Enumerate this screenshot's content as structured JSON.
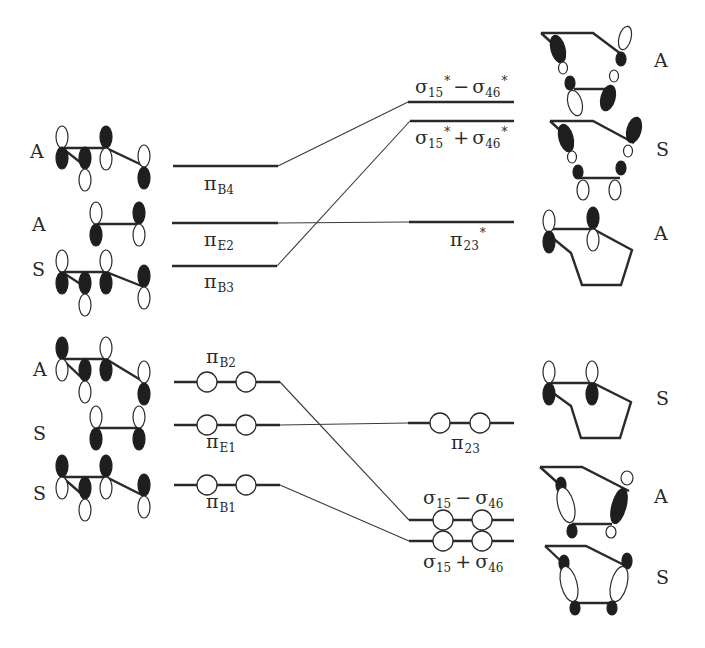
{
  "diagram": {
    "colors": {
      "ink": "#2a2a2a",
      "filled_lobe": "#1e1e1e",
      "background": "#ffffff"
    },
    "left_levels": [
      {
        "id": "piB4",
        "label": "π",
        "sub": "B4",
        "sup": "",
        "symmetry": "A",
        "y": 166,
        "x1": 173,
        "x2": 278,
        "occupied": false,
        "label_pos": "below"
      },
      {
        "id": "piE2",
        "label": "π",
        "sub": "E2",
        "sup": "",
        "symmetry": "A",
        "y": 223,
        "x1": 172,
        "x2": 278,
        "occupied": false,
        "label_pos": "below"
      },
      {
        "id": "piB3",
        "label": "π",
        "sub": "B3",
        "sup": "",
        "symmetry": "S",
        "y": 266,
        "x1": 172,
        "x2": 277,
        "occupied": false,
        "label_pos": "below"
      },
      {
        "id": "piB2",
        "label": "π",
        "sub": "B2",
        "sup": "",
        "symmetry": "A",
        "y": 382,
        "x1": 174,
        "x2": 280,
        "occupied": true,
        "label_pos": "above"
      },
      {
        "id": "piE1",
        "label": "π",
        "sub": "E1",
        "sup": "",
        "symmetry": "S",
        "y": 425,
        "x1": 174,
        "x2": 280,
        "occupied": true,
        "label_pos": "below"
      },
      {
        "id": "piB1",
        "label": "π",
        "sub": "B1",
        "sup": "",
        "symmetry": "S",
        "y": 485,
        "x1": 174,
        "x2": 280,
        "occupied": true,
        "label_pos": "below"
      }
    ],
    "right_levels": [
      {
        "id": "sigStarMinus",
        "text": "σ15* − σ46*",
        "symmetry": "A",
        "y": 102,
        "x1": 408,
        "x2": 514,
        "occupied": false,
        "label_pos": "above"
      },
      {
        "id": "sigStarPlus",
        "text": "σ15* + σ46*",
        "symmetry": "S",
        "y": 121,
        "x1": 410,
        "x2": 514,
        "occupied": false,
        "label_pos": "below"
      },
      {
        "id": "pi23Star",
        "text": "π23*",
        "symmetry": "A",
        "y": 222,
        "x1": 409,
        "x2": 514,
        "occupied": false,
        "label_pos": "below"
      },
      {
        "id": "pi23",
        "text": "π23",
        "symmetry": "S",
        "y": 423,
        "x1": 408,
        "x2": 514,
        "occupied": true,
        "label_pos": "below"
      },
      {
        "id": "sigMinus",
        "text": "σ15 − σ46",
        "symmetry": "A",
        "y": 520,
        "x1": 409,
        "x2": 514,
        "occupied": true,
        "label_pos": "above"
      },
      {
        "id": "sigPlus",
        "text": "σ15 + σ46",
        "symmetry": "S",
        "y": 541,
        "x1": 409,
        "x2": 514,
        "occupied": true,
        "label_pos": "below"
      }
    ],
    "correlations": [
      {
        "from": "piB4",
        "to": "sigStarMinus"
      },
      {
        "from": "piE2",
        "to": "pi23Star"
      },
      {
        "from": "piB3",
        "to": "sigStarPlus"
      },
      {
        "from": "piB2",
        "to": "sigMinus"
      },
      {
        "from": "piE1",
        "to": "pi23"
      },
      {
        "from": "piB1",
        "to": "sigPlus"
      }
    ],
    "left_symmetry_labels": [
      {
        "text": "A",
        "y": 158
      },
      {
        "text": "A",
        "y": 224
      },
      {
        "text": "S",
        "y": 275
      },
      {
        "text": "A",
        "y": 368
      },
      {
        "text": "S",
        "y": 432
      },
      {
        "text": "S",
        "y": 492
      }
    ],
    "right_symmetry_labels": [
      {
        "text": "A",
        "y": 67
      },
      {
        "text": "S",
        "y": 154
      },
      {
        "text": "A",
        "y": 239
      },
      {
        "text": "S",
        "y": 404
      },
      {
        "text": "A",
        "y": 503
      },
      {
        "text": "S",
        "y": 584
      }
    ],
    "labels_text": {
      "piB4": {
        "main": "π",
        "sub": "B4"
      },
      "piE2": {
        "main": "π",
        "sub": "E2"
      },
      "piB3": {
        "main": "π",
        "sub": "B3"
      },
      "piB2": {
        "main": "π",
        "sub": "B2"
      },
      "piE1": {
        "main": "π",
        "sub": "E1"
      },
      "piB1": {
        "main": "π",
        "sub": "B1"
      },
      "pi23Star": {
        "main": "π",
        "sub": "23",
        "sup": "*"
      },
      "pi23": {
        "main": "π",
        "sub": "23"
      },
      "sigStarMinus": {
        "a": "σ",
        "asub": "15",
        "asup": "*",
        "op": "−",
        "b": "σ",
        "bsub": "46",
        "bsup": "*"
      },
      "sigStarPlus": {
        "a": "σ",
        "asub": "15",
        "asup": "*",
        "op": "+",
        "b": "σ",
        "bsub": "46",
        "bsup": "*"
      },
      "sigMinus": {
        "a": "σ",
        "asub": "15",
        "op": "−",
        "b": "σ",
        "bsub": "46"
      },
      "sigPlus": {
        "a": "σ",
        "asub": "15",
        "op": "+",
        "b": "σ",
        "bsub": "46"
      }
    }
  }
}
